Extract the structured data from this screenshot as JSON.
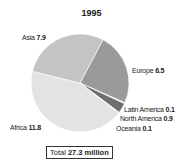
{
  "chart_data": {
    "type": "pie",
    "title": "1995",
    "unit": "million",
    "slices": [
      {
        "label": "Europe",
        "value": 6.5,
        "color": "#9a9a9a"
      },
      {
        "label": "Latin America",
        "value": 0.1,
        "color": "#e0e0e0"
      },
      {
        "label": "North America",
        "value": 0.9,
        "color": "#6e6e6e"
      },
      {
        "label": "Oceania",
        "value": 0.1,
        "color": "#e0e0e0"
      },
      {
        "label": "Africa",
        "value": 11.8,
        "color": "#e3e3e3"
      },
      {
        "label": "Asia",
        "value": 7.9,
        "color": "#c4c4c4"
      }
    ],
    "total_label": "Total",
    "total_value": "27.3 million",
    "legend": "none (direct labels)"
  },
  "labels": {
    "europe": {
      "name": "Europe",
      "value": "6.5"
    },
    "latin_america": {
      "name": "Latin America",
      "value": "0.1"
    },
    "north_america": {
      "name": "North America",
      "value": "0.9"
    },
    "oceania": {
      "name": "Oceania",
      "value": "0.1"
    },
    "africa": {
      "name": "Africa",
      "value": "11.8"
    },
    "asia": {
      "name": "Asia",
      "value": "7.9"
    }
  },
  "total": {
    "label": "Total",
    "value": "27.3 million"
  }
}
